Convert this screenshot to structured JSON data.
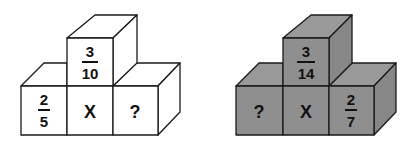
{
  "colors": {
    "left_fill": "#ffffff",
    "right_front": "#8f8f8f",
    "right_top": "#999999",
    "right_side": "#878787",
    "stroke": "#1a1a1a"
  },
  "figures": [
    {
      "name": "left",
      "top": {
        "num": "3",
        "den": "10"
      },
      "bottom": [
        {
          "num": "2",
          "den": "5"
        },
        {
          "text": "X"
        },
        {
          "text": "?"
        }
      ]
    },
    {
      "name": "right",
      "top": {
        "num": "3",
        "den": "14"
      },
      "bottom": [
        {
          "text": "?"
        },
        {
          "text": "X"
        },
        {
          "num": "2",
          "den": "7"
        }
      ]
    }
  ]
}
